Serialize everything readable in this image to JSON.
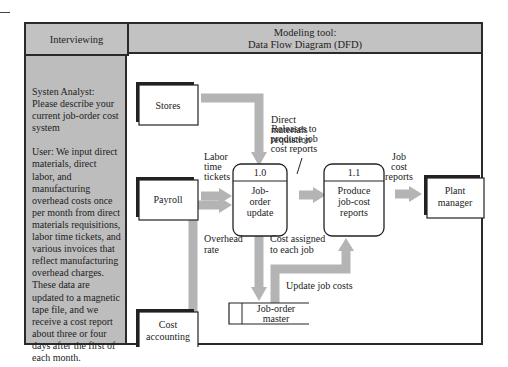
{
  "header": {
    "left_title": "Interviewing",
    "right_title_line1": "Modeling tool:",
    "right_title_line2": "Data Flow Diagram (DFD)"
  },
  "sidebar": {
    "analyst_text": "Systen Analyst: Please describe your current job-order cost system",
    "user_text": "User:  We input direct materials, direct labor, and manufacturing overhead costs once per month from direct materials requisitions, labor time tickets, and various invoices that reflect manufacturing overhead charges. These data are updated to a  magnetic tape file, and we receive a cost report about three or four days after the first of each month."
  },
  "diagram": {
    "entities": {
      "stores": "Stores",
      "payroll": "Payroll",
      "cost_accounting": [
        "Cost",
        "accounting"
      ],
      "plant_manager": [
        "Plant",
        "manager"
      ]
    },
    "processes": [
      {
        "id": "1.0",
        "lines": [
          "Job-",
          "order",
          "update"
        ]
      },
      {
        "id": "1.1",
        "lines": [
          "Produce",
          "job-cost",
          "reports"
        ]
      }
    ],
    "data_store": {
      "lines": [
        "Job-order",
        "master"
      ]
    },
    "flows": {
      "direct_materials": [
        "Direct",
        "materials",
        "requistion"
      ],
      "labor_time": [
        "Labor",
        "time",
        "tickets"
      ],
      "overhead_rate": [
        "Overhead",
        "rate"
      ],
      "releases": [
        "Releases to",
        "produce job",
        "cost reports"
      ],
      "job_cost_reports": [
        "Job",
        "cost",
        "reports"
      ],
      "cost_assigned": [
        "Cost assigned",
        "to each job"
      ],
      "update_job_costs": "Update job costs"
    }
  },
  "colors": {
    "header_bg": "#c2c2c2",
    "sidebar_bg": "#bdbdbd",
    "arrow": "#b4b4b4",
    "border": "#2a2a2a"
  }
}
